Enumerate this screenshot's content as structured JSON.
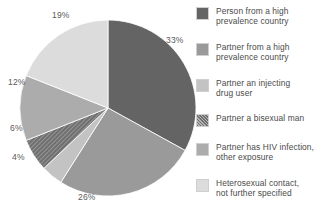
{
  "chart_data": {
    "type": "pie",
    "title": "",
    "subtitle": "",
    "xlabel": "",
    "ylabel": "",
    "grid": false,
    "legend_position": "right",
    "start_angle_deg": 0,
    "direction": "clockwise",
    "categories": [
      "Person from a high prevalence country",
      "Partner from a high prevalence country",
      "Partner an injecting drug user",
      "Partner a bisexual man",
      "Partner has HIV infection, other exposure",
      "Heterosexual contact, not further specified"
    ],
    "values": [
      33,
      26,
      4,
      6,
      12,
      19
    ],
    "data_labels": [
      "33%",
      "26%",
      "4%",
      "6%",
      "12%",
      "19%"
    ],
    "colors": [
      "#646464",
      "#9a9a9a",
      "#c3c3c3",
      "#6f6f6f",
      "#acacac",
      "#dcdcdc"
    ],
    "patterns": [
      "solid",
      "solid",
      "solid",
      "hatch",
      "solid",
      "solid"
    ]
  },
  "pie": {
    "slices": [
      {
        "label": "33%",
        "value": 33,
        "color": "#646464",
        "pattern": "solid",
        "label_x": 166,
        "label_y": 35
      },
      {
        "label": "26%",
        "value": 26,
        "color": "#9a9a9a",
        "pattern": "solid",
        "label_x": 78,
        "label_y": 192
      },
      {
        "label": "4%",
        "value": 4,
        "color": "#c3c3c3",
        "pattern": "solid",
        "label_x": 12,
        "label_y": 152
      },
      {
        "label": "6%",
        "value": 6,
        "color": "#6f6f6f",
        "pattern": "hatch",
        "label_x": 10,
        "label_y": 123
      },
      {
        "label": "12%",
        "value": 12,
        "color": "#acacac",
        "pattern": "solid",
        "label_x": 8,
        "label_y": 77
      },
      {
        "label": "19%",
        "value": 19,
        "color": "#dcdcdc",
        "pattern": "solid",
        "label_x": 52,
        "label_y": 10
      }
    ],
    "center_x": 108,
    "center_y": 108,
    "radius": 88
  },
  "legend": {
    "items": [
      {
        "swatch_color": "#646464",
        "pattern": "solid",
        "label": "Person from a high\nprevalence country"
      },
      {
        "swatch_color": "#9a9a9a",
        "pattern": "solid",
        "label": "Partner from a high\nprevalence country"
      },
      {
        "swatch_color": "#c3c3c3",
        "pattern": "solid",
        "label": "Partner an injecting\ndrug user"
      },
      {
        "swatch_color": "#6f6f6f",
        "pattern": "hatch",
        "label": "Partner a bisexual man"
      },
      {
        "swatch_color": "#acacac",
        "pattern": "solid",
        "label": "Partner has HIV infection,\nother exposure"
      },
      {
        "swatch_color": "#dcdcdc",
        "pattern": "solid",
        "label": "Heterosexual contact,\nnot further specified"
      }
    ]
  }
}
